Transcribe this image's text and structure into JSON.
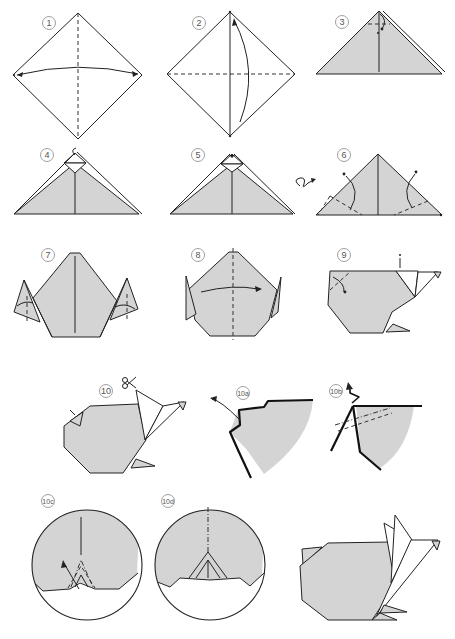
{
  "diagram": {
    "colors": {
      "paper_gray": "#d4d4d4",
      "line": "#222222",
      "background": "#ffffff"
    },
    "steps": [
      {
        "label": "1",
        "description": "Square diamond, valley fold vertical diagonal, arrow left-right"
      },
      {
        "label": "2",
        "description": "Diamond with horizontal valley fold, arrow bottom to top"
      },
      {
        "label": "3",
        "description": "Triangle, fold top tip down"
      },
      {
        "label": "4",
        "description": "Triangle with folded tip"
      },
      {
        "label": "5",
        "description": "Triangle with folded tip, turn over"
      },
      {
        "label": "6",
        "description": "Triangle with valley folds on both sides"
      },
      {
        "label": "7",
        "description": "Shape with side flaps folded up"
      },
      {
        "label": "8",
        "description": "Fold in half along vertical valley"
      },
      {
        "label": "9",
        "description": "Body shape with head, fold corner"
      },
      {
        "label": "10",
        "description": "Cut ears with scissors"
      },
      {
        "label": "10a",
        "description": "Detail: pull flap out"
      },
      {
        "label": "10b",
        "description": "Detail: zigzag fold"
      },
      {
        "label": "10c",
        "description": "Circle detail: pleat fold"
      },
      {
        "label": "10d",
        "description": "Circle detail: result"
      }
    ],
    "symbols": {
      "turn_over": "turn-over-icon",
      "scissors": "scissors-icon"
    }
  }
}
